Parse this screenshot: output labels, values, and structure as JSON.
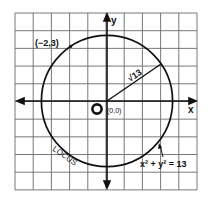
{
  "diagram": {
    "grid": {
      "columns": 10,
      "rows": 10,
      "unit_px": 18.2,
      "left": 15,
      "top": 13,
      "line_color": "#555555",
      "background": "#ffffff"
    },
    "axes": {
      "x_label": "x",
      "y_label": "y",
      "origin_px": [
        107,
        101
      ],
      "color": "#111111"
    },
    "origin": {
      "marker_label": "O",
      "coord_label": "(0,0)"
    },
    "circle": {
      "center": [
        0,
        0
      ],
      "radius_squared": 13,
      "radius_label": "√13",
      "radius_value": 3.606,
      "stroke": "#111111"
    },
    "point": {
      "label": "(−2,3)",
      "x": -2,
      "y": 3
    },
    "locus_label": "LOCUS",
    "equation_label": "x² + y² = 13"
  }
}
